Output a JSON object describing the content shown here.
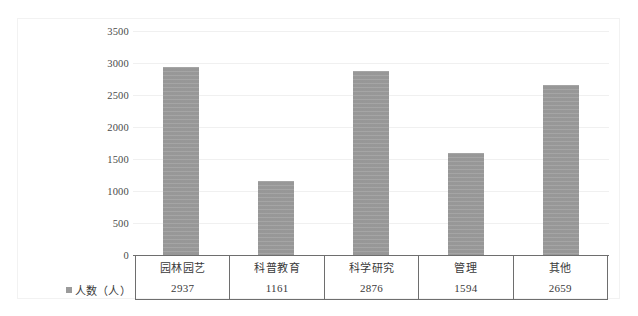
{
  "chart_data": {
    "type": "bar",
    "title": "",
    "xlabel": "",
    "ylabel": "",
    "categories": [
      "园林园艺",
      "科普教育",
      "科学研究",
      "管理",
      "其他"
    ],
    "values": [
      2937,
      1161,
      2876,
      1594,
      2659
    ],
    "series": [
      {
        "name": "人数（人）",
        "values": [
          2937,
          1161,
          2876,
          1594,
          2659
        ],
        "color": "#9b9b9b"
      }
    ],
    "ylim": [
      0,
      3500
    ],
    "y_ticks": [
      0,
      500,
      1000,
      1500,
      2000,
      2500,
      3000,
      3500
    ],
    "y_tick_labels": [
      "0",
      "500",
      "1000",
      "1500",
      "2000",
      "2500",
      "3000",
      "3500"
    ],
    "grid": true,
    "grid_axis": "y",
    "legend_position": "left",
    "data_table_visible": true
  },
  "legend": {
    "marker": "square-marker",
    "label": "人数（人）"
  },
  "table": {
    "row_category_label": "",
    "row_value_label": "人数（人）"
  },
  "colors": {
    "bar_fill": "#9b9b9b",
    "axis_line": "#6e6e6e",
    "gridline": "#f0f0f0",
    "frame_border": "#f2f2f2",
    "text": "#3a3a3a"
  }
}
